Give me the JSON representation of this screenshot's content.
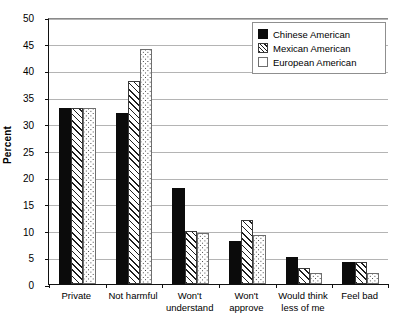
{
  "chart_data": {
    "type": "bar",
    "title": "",
    "xlabel": "",
    "ylabel": "Percent",
    "ylim": [
      0,
      50
    ],
    "ytick_step": 5,
    "yticks": [
      0,
      5,
      10,
      15,
      20,
      25,
      30,
      35,
      40,
      45,
      50
    ],
    "grid": true,
    "legend_position": "top-right",
    "categories": [
      "Private",
      "Not harmful",
      "Won't understand",
      "Won't approve",
      "Would think less of me",
      "Feel bad"
    ],
    "category_lines": [
      [
        "Private"
      ],
      [
        "Not harmful"
      ],
      [
        "Won't",
        "understand"
      ],
      [
        "Won't",
        "approve"
      ],
      [
        "Would think",
        "less of me"
      ],
      [
        "Feel bad"
      ]
    ],
    "series": [
      {
        "name": "Chinese American",
        "fill": "solid-black",
        "color": "#0b0b0b",
        "values": [
          33,
          32,
          18,
          8,
          5,
          4.2
        ]
      },
      {
        "name": "Mexican American",
        "fill": "diagonal-hatch",
        "color": "#ffffff",
        "values": [
          33,
          38,
          10,
          12,
          3,
          4.2
        ]
      },
      {
        "name": "European American",
        "fill": "dotted",
        "color": "#ffffff",
        "values": [
          33,
          44,
          9.5,
          9.2,
          2,
          2
        ]
      }
    ]
  }
}
